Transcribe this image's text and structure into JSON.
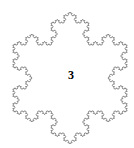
{
  "figure": {
    "type": "koch-snowflake",
    "label": "3",
    "iterations": 4,
    "center": [
      70,
      78
    ],
    "radius": 66,
    "orientation": "vertex-up",
    "stroke_color": "#7a7a7a",
    "stroke_width": 0.9,
    "background": "#ffffff",
    "label_color": "#000000"
  }
}
